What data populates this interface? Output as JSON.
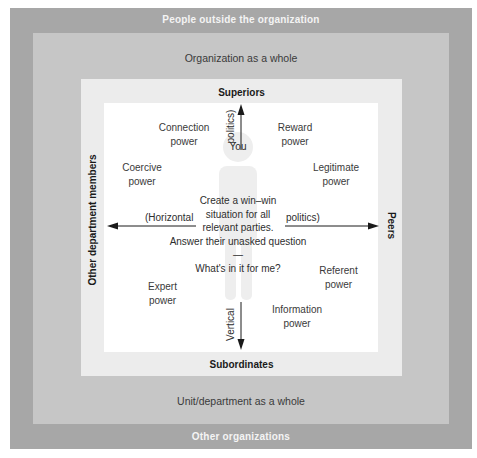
{
  "rings": {
    "outer_top": "People outside the organization",
    "outer_bottom": "Other organizations",
    "organization": "Organization as a whole",
    "unit": "Unit/department as a whole"
  },
  "directions": {
    "top": "Superiors",
    "bottom": "Subordinates",
    "left": "Other department members",
    "right": "Peers"
  },
  "arrows": {
    "up_label": "politics)",
    "down_label": "Vertical",
    "left_label": "(Horizontal",
    "right_label": "politics)"
  },
  "powers": {
    "connection": [
      "Connection",
      "power"
    ],
    "reward": [
      "Reward",
      "power"
    ],
    "coercive": [
      "Coercive",
      "power"
    ],
    "legitimate": [
      "Legitimate",
      "power"
    ],
    "expert": [
      "Expert",
      "power"
    ],
    "referent": [
      "Referent",
      "power"
    ],
    "information": [
      "Information",
      "power"
    ]
  },
  "center": {
    "you": "You",
    "lines": [
      "Create a win–win",
      "situation for all",
      "relevant parties.",
      "Answer their unasked question —",
      "What's in it for me?"
    ]
  },
  "colors": {
    "outer": "#a7a7a7",
    "organization": "#c6c6c6",
    "unit": "#ececec",
    "inner": "#ffffff",
    "silhouette": "#ededed"
  }
}
